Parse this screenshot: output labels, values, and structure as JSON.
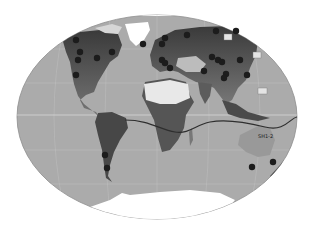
{
  "map": {
    "projection": "world-elliptical",
    "colors": {
      "background": "#ffffff",
      "ocean": "#ababab",
      "ocean_edge": "#8e8e8e",
      "graticule": "#c4c4c4",
      "equator": "#d8d8d8",
      "land_dark": "#3a3a3a",
      "land_mid": "#6e6e6e",
      "land_light": "#a6a6a6",
      "ice": "#ffffff",
      "desert": "#e6e6e6",
      "site_dot": "#1c1c1c",
      "route_line": "#2e2e2e"
    },
    "labels": [
      {
        "id": "sh1-2",
        "text": "SH1-2",
        "x": 258,
        "y": 138
      }
    ],
    "label_boxes": [
      {
        "x": 224,
        "y": 34,
        "w": 8,
        "h": 6
      },
      {
        "x": 253,
        "y": 52,
        "w": 8,
        "h": 6
      },
      {
        "x": 258,
        "y": 88,
        "w": 9,
        "h": 6
      }
    ],
    "sites": [
      {
        "x": 76,
        "y": 40
      },
      {
        "x": 80,
        "y": 52
      },
      {
        "x": 78,
        "y": 60
      },
      {
        "x": 97,
        "y": 58
      },
      {
        "x": 112,
        "y": 52
      },
      {
        "x": 76,
        "y": 75
      },
      {
        "x": 143,
        "y": 44
      },
      {
        "x": 165,
        "y": 38
      },
      {
        "x": 162,
        "y": 44
      },
      {
        "x": 162,
        "y": 60
      },
      {
        "x": 165,
        "y": 63
      },
      {
        "x": 170,
        "y": 68
      },
      {
        "x": 187,
        "y": 35
      },
      {
        "x": 216,
        "y": 31
      },
      {
        "x": 236,
        "y": 31
      },
      {
        "x": 212,
        "y": 57
      },
      {
        "x": 218,
        "y": 60
      },
      {
        "x": 222,
        "y": 62
      },
      {
        "x": 240,
        "y": 60
      },
      {
        "x": 204,
        "y": 71
      },
      {
        "x": 226,
        "y": 74
      },
      {
        "x": 224,
        "y": 78
      },
      {
        "x": 247,
        "y": 75
      },
      {
        "x": 105,
        "y": 155
      },
      {
        "x": 107,
        "y": 168
      },
      {
        "x": 252,
        "y": 167
      },
      {
        "x": 273,
        "y": 162
      }
    ],
    "route": "M125,120 C150,120 160,130 175,132 S195,125 210,122 S245,122 265,127 S290,118 297,117"
  }
}
